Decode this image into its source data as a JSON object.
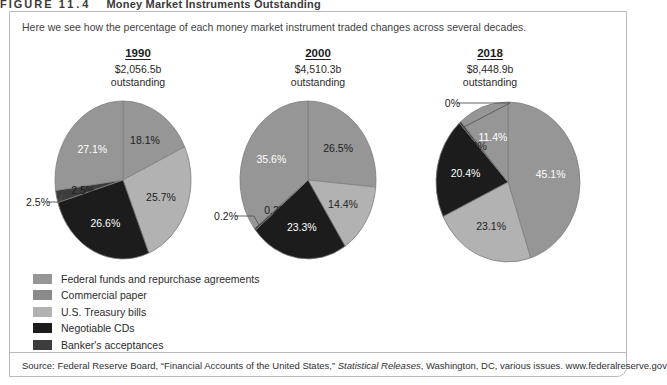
{
  "figure": {
    "label": "FIGURE",
    "number": "11.4",
    "title": "Money Market Instruments Outstanding",
    "intro": "Here we see how the percentage of each money market instrument traded changes across several decades."
  },
  "columns": [
    {
      "year": "1990",
      "amount": "$2,056.5b",
      "outstanding": "outstanding"
    },
    {
      "year": "2000",
      "amount": "$4,510.3b",
      "outstanding": "outstanding"
    },
    {
      "year": "2018",
      "amount": "$8,448.9b",
      "outstanding": "outstanding"
    }
  ],
  "legend": {
    "items": [
      {
        "label": "Federal funds and repurchase agreements",
        "color": "#969696"
      },
      {
        "label": "Commercial paper",
        "color": "#8a8a8a"
      },
      {
        "label": "U.S. Treasury bills",
        "color": "#b2b2b2"
      },
      {
        "label": "Negotiable CDs",
        "color": "#1c1c1c"
      },
      {
        "label": "Banker's acceptances",
        "color": "#3d3d3d"
      }
    ]
  },
  "source": {
    "prefix": "Source: Federal Reserve Board, “Financial Accounts of the United States,” ",
    "italic": "Statistical Releases",
    "suffix": ", Washington, DC, various issues. www.federalreserve.gov"
  },
  "chart_data": [
    {
      "type": "pie",
      "title": "1990",
      "subtitle": "$2,056.5b outstanding",
      "categories": [
        "Federal funds and repurchase agreements",
        "Commercial paper",
        "Negotiable CDs",
        "Banker's acceptances",
        "U.S. Treasury bills"
      ],
      "values": [
        18.1,
        25.7,
        26.6,
        2.5,
        27.1
      ],
      "labels": [
        "18.1%",
        "25.7%",
        "26.6%",
        "2.5%",
        "27.1%"
      ],
      "colors": [
        "#969696",
        "#b2b2b2",
        "#1c1c1c",
        "#3d3d3d",
        "#969696"
      ],
      "label_colors": [
        "dark",
        "dark",
        "light",
        "dark",
        "light"
      ],
      "callout": [
        "2.5%"
      ],
      "legend_position": "bottom-left"
    },
    {
      "type": "pie",
      "title": "2000",
      "subtitle": "$4,510.3b outstanding",
      "categories": [
        "Federal funds and repurchase agreements",
        "Commercial paper",
        "Negotiable CDs",
        "Banker's acceptances",
        "U.S. Treasury bills"
      ],
      "values": [
        26.5,
        14.4,
        23.3,
        0.2,
        35.6
      ],
      "labels": [
        "26.5%",
        "14.4%",
        "23.3%",
        "0.2%",
        "35.6%"
      ],
      "colors": [
        "#969696",
        "#b2b2b2",
        "#1c1c1c",
        "#3d3d3d",
        "#969696"
      ],
      "label_colors": [
        "dark",
        "dark",
        "light",
        "dark",
        "light"
      ],
      "callout": [
        "0.2%"
      ],
      "legend_position": "bottom-left"
    },
    {
      "type": "pie",
      "title": "2018",
      "subtitle": "$8,448.9b outstanding",
      "categories": [
        "Federal funds and repurchase agreements",
        "Commercial paper",
        "Negotiable CDs",
        "Banker's acceptances",
        "U.S. Treasury bills"
      ],
      "values": [
        45.1,
        23.1,
        20.4,
        0.0,
        11.4
      ],
      "labels": [
        "45.1%",
        "23.1%",
        "20.4%",
        "0%",
        "11.4%"
      ],
      "colors": [
        "#969696",
        "#b2b2b2",
        "#1c1c1c",
        "#3d3d3d",
        "#969696"
      ],
      "label_colors": [
        "light",
        "dark",
        "light",
        "dark",
        "light"
      ],
      "callout": [
        "0%"
      ],
      "legend_position": "bottom-left"
    }
  ]
}
